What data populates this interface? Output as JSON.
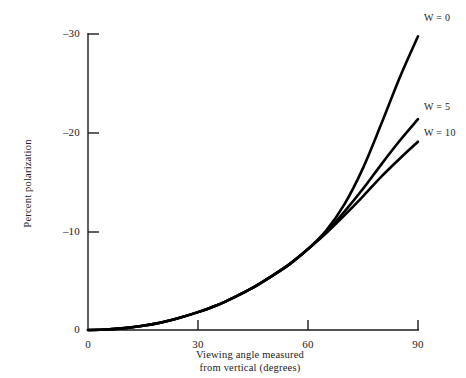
{
  "chart_data": {
    "type": "line",
    "title": "",
    "xlabel": "Viewing angle measured from vertical (degrees)",
    "xlabel_lines": [
      "Viewing angle measured",
      "from vertical (degrees)"
    ],
    "ylabel": "Percent polarization",
    "xlim": [
      0,
      90
    ],
    "ylim": [
      -31.5,
      0
    ],
    "xticks": [
      0,
      30,
      60,
      90
    ],
    "xtick_labels": [
      "0",
      "30",
      "60",
      "90"
    ],
    "yticks": [
      0,
      -10,
      -20,
      -30
    ],
    "ytick_labels": [
      "0",
      "–10",
      "–20",
      "–30"
    ],
    "grid": false,
    "legend_position": "right-inline-annotations",
    "line_color": "#000000",
    "axis_color": "#1a1a1a",
    "background": "#ffffff",
    "x": [
      0,
      5,
      10,
      15,
      20,
      25,
      30,
      35,
      40,
      45,
      50,
      55,
      60,
      65,
      70,
      75,
      80,
      85,
      90
    ],
    "series": [
      {
        "name": "W = 0",
        "label": "W = 0",
        "values": [
          0,
          -0.05,
          -0.2,
          -0.45,
          -0.8,
          -1.3,
          -1.9,
          -2.6,
          -3.5,
          -4.5,
          -5.7,
          -7.0,
          -8.6,
          -10.6,
          -13.4,
          -17.2,
          -21.9,
          -26.8,
          -31.2
        ]
      },
      {
        "name": "W = 5",
        "label": "W = 5",
        "values": [
          0,
          -0.05,
          -0.2,
          -0.45,
          -0.8,
          -1.3,
          -1.9,
          -2.6,
          -3.5,
          -4.5,
          -5.7,
          -7.0,
          -8.6,
          -10.4,
          -12.6,
          -15.0,
          -17.6,
          -20.1,
          -22.4
        ]
      },
      {
        "name": "W = 10",
        "label": "W = 10",
        "values": [
          0,
          -0.05,
          -0.2,
          -0.45,
          -0.8,
          -1.3,
          -1.9,
          -2.6,
          -3.5,
          -4.5,
          -5.7,
          -7.0,
          -8.6,
          -10.3,
          -12.2,
          -14.2,
          -16.3,
          -18.2,
          -20.0
        ]
      }
    ]
  },
  "axes": {
    "y_title": "Percent polarization",
    "x_title_line1": "Viewing angle measured",
    "x_title_line2": "from vertical (degrees)"
  },
  "ticks": {
    "y": [
      {
        "label": "–30",
        "value": -30
      },
      {
        "label": "–20",
        "value": -20
      },
      {
        "label": "–10",
        "value": -10
      },
      {
        "label": "0",
        "value": 0
      }
    ],
    "x": [
      {
        "label": "0",
        "value": 0
      },
      {
        "label": "30",
        "value": 30
      },
      {
        "label": "60",
        "value": 60
      },
      {
        "label": "90",
        "value": 90
      }
    ]
  },
  "annotations": [
    {
      "label": "W = 0"
    },
    {
      "label": "W = 5"
    },
    {
      "label": "W = 10"
    }
  ]
}
